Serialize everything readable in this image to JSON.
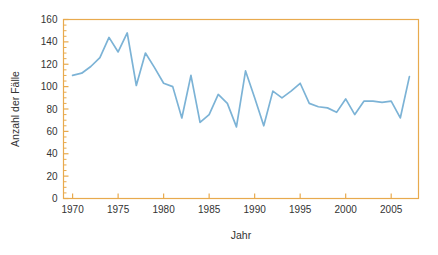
{
  "chart_data": {
    "type": "line",
    "title": "",
    "xlabel": "Jahr",
    "ylabel": "Anzahl der Fälle",
    "xlim": [
      1969,
      2008
    ],
    "ylim": [
      0,
      160
    ],
    "xticks": [
      1970,
      1975,
      1980,
      1985,
      1990,
      1995,
      2000,
      2005
    ],
    "xtick_labels": [
      "1970",
      "1975",
      "1980",
      "1985",
      "1990",
      "1995",
      "2000",
      "2005"
    ],
    "yticks": [
      0,
      20,
      40,
      60,
      80,
      100,
      120,
      140,
      160
    ],
    "ytick_labels": [
      "0",
      "20",
      "40",
      "60",
      "80",
      "100",
      "120",
      "140",
      "160"
    ],
    "y_minor_tick_step": 5,
    "grid": false,
    "legend": "none",
    "series": [
      {
        "name": "Anzahl der Fälle",
        "color": "#7cb3d6",
        "x": [
          1970,
          1971,
          1972,
          1973,
          1974,
          1975,
          1976,
          1977,
          1978,
          1979,
          1980,
          1981,
          1982,
          1983,
          1984,
          1985,
          1986,
          1987,
          1988,
          1989,
          1990,
          1991,
          1992,
          1993,
          1994,
          1995,
          1996,
          1997,
          1998,
          1999,
          2000,
          2001,
          2002,
          2003,
          2004,
          2005,
          2006,
          2007
        ],
        "values": [
          110,
          112,
          118,
          126,
          144,
          131,
          148,
          101,
          130,
          117,
          103,
          100,
          72,
          110,
          68,
          75,
          93,
          85,
          64,
          114,
          90,
          65,
          96,
          90,
          96,
          103,
          85,
          82,
          81,
          77,
          89,
          75,
          87,
          87,
          86,
          87,
          72,
          109
        ]
      }
    ]
  },
  "axis_style": {
    "frame_color": "#e8aa4e",
    "tick_color": "#e8aa4e",
    "line_color": "#7cb3d6",
    "text_color": "#333333"
  }
}
